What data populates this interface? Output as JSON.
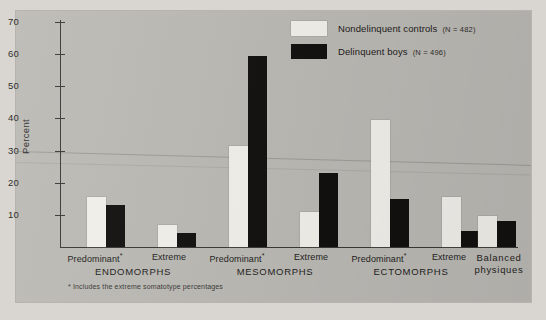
{
  "chart_data": {
    "type": "bar",
    "title": "",
    "xlabel": "",
    "ylabel": "Percent",
    "ylim": [
      0,
      70
    ],
    "yticks": [
      10,
      20,
      30,
      40,
      50,
      60,
      70
    ],
    "grid": false,
    "legend_position": "top-right",
    "categories": [
      "Predominant*",
      "Extreme",
      "Predominant*",
      "Extreme",
      "Predominant*",
      "Extreme",
      "Balanced physiques"
    ],
    "groups": [
      {
        "name": "ENDOMORPHS",
        "categories": [
          "Predominant*",
          "Extreme"
        ]
      },
      {
        "name": "MESOMORPHS",
        "categories": [
          "Predominant*",
          "Extreme"
        ]
      },
      {
        "name": "ECTOMORPHS",
        "categories": [
          "Predominant*",
          "Extreme"
        ]
      },
      {
        "name": "Balanced physiques",
        "categories": []
      }
    ],
    "series": [
      {
        "name": "Nondelinquent controls",
        "n_label": "(N = 482)",
        "color": "#f3f1ec",
        "values": [
          15.5,
          7,
          31.5,
          11,
          39.5,
          15.5,
          9.5
        ]
      },
      {
        "name": "Delinquent boys",
        "n_label": "(N = 496)",
        "color": "#121110",
        "values": [
          13,
          4.5,
          59.5,
          23,
          15,
          5,
          8
        ]
      }
    ],
    "footnote": "* Includes the extreme somatotype percentages"
  },
  "axis": {
    "y_label": "Percent",
    "y_ticks": [
      "70",
      "60",
      "50",
      "40",
      "30",
      "20",
      "10"
    ]
  },
  "legend": {
    "items": [
      {
        "label": "Nondelinquent controls",
        "n": "(N = 482)",
        "swatch": "control"
      },
      {
        "label": "Delinquent boys",
        "n": "(N = 496)",
        "swatch": "delinquent"
      }
    ]
  },
  "x_axis": {
    "categories": [
      {
        "label": "Predominant",
        "star": "*"
      },
      {
        "label": "Extreme",
        "star": ""
      },
      {
        "label": "Predominant",
        "star": "*"
      },
      {
        "label": "Extreme",
        "star": ""
      },
      {
        "label": "Predominant",
        "star": "*"
      },
      {
        "label": "Extreme",
        "star": ""
      },
      {
        "label": "Balanced",
        "star": ""
      }
    ],
    "groups": [
      "ENDOMORPHS",
      "MESOMORPHS",
      "ECTOMORPHS"
    ],
    "balanced_line1": "Balanced",
    "balanced_line2": "physiques"
  },
  "footnote": "* Includes the extreme somatotype percentages",
  "colors": {
    "panel_background": "#bcbab5",
    "page_background": "#d9d6d1",
    "control_bar": "#f3f1ec",
    "delinquent_bar": "#121110",
    "axis": "#3a3935"
  }
}
